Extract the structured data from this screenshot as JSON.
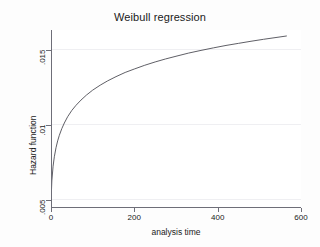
{
  "chart_data": {
    "type": "line",
    "title": "Weibull regression",
    "xlabel": "analysis time",
    "ylabel": "Hazard function",
    "xlim": [
      0,
      600
    ],
    "ylim": [
      0.0045,
      0.0163
    ],
    "xticks": [
      0,
      200,
      400,
      600
    ],
    "xticklabels": [
      "0",
      "200",
      "400",
      "600"
    ],
    "yticks": [
      0.005,
      0.01,
      0.015
    ],
    "yticklabels": [
      ".005",
      ".01",
      ".015"
    ],
    "grid": "horizontal-faint",
    "legend": null,
    "series": [
      {
        "name": "Hazard function",
        "color": "#4d4d55",
        "x": [
          0,
          2,
          5,
          8,
          12,
          16,
          20,
          26,
          32,
          40,
          50,
          60,
          72,
          85,
          100,
          118,
          136,
          156,
          178,
          200,
          225,
          250,
          275,
          300,
          330,
          360,
          390,
          420,
          450,
          480,
          510,
          540,
          565
        ],
        "y": [
          0.00478,
          0.00624,
          0.00722,
          0.00785,
          0.00845,
          0.00891,
          0.00928,
          0.00973,
          0.0101,
          0.01052,
          0.01094,
          0.01128,
          0.01163,
          0.01196,
          0.01229,
          0.01262,
          0.01291,
          0.01319,
          0.01347,
          0.0137,
          0.01395,
          0.01417,
          0.01437,
          0.01455,
          0.01476,
          0.01494,
          0.01511,
          0.01527,
          0.01541,
          0.01555,
          0.01568,
          0.0158,
          0.0159
        ]
      }
    ]
  },
  "figure": {
    "background_color": "#fdfdfd",
    "plot_background_color": "#ffffff",
    "axis_color": "#6e6e78",
    "line_color": "#4d4d55",
    "grid_color": "#efeff2"
  }
}
